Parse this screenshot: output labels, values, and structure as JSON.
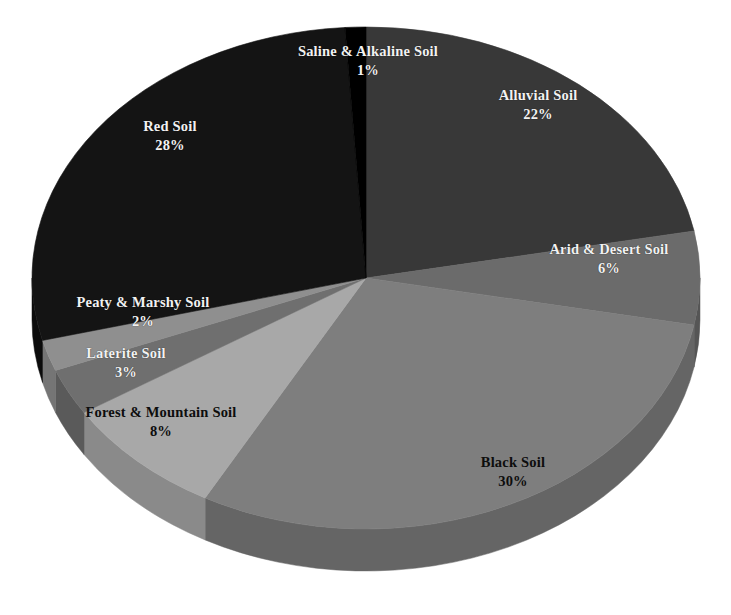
{
  "chart_data": {
    "type": "pie",
    "title": "",
    "subtitle": "",
    "xlabel": "",
    "ylabel": "",
    "legend_position": "none",
    "grid": false,
    "label_format": "name + percent",
    "start_angle_deg": 0,
    "direction": "clockwise",
    "three_d": true,
    "categories": [
      "Alluvial Soil",
      "Arid & Desert Soil",
      "Black Soil",
      "Forest & Mountain Soil",
      "Laterite Soil",
      "Peaty & Marshy Soil",
      "Red Soil",
      "Saline & Alkaline Soil"
    ],
    "values": [
      22,
      6,
      30,
      8,
      3,
      2,
      28,
      1
    ],
    "unit": "%",
    "total": 100,
    "slices": [
      {
        "name": "Alluvial Soil",
        "value": 22,
        "value_label": "22%",
        "color": "#383838",
        "side_color": "#2b2b2b",
        "label_color": "light"
      },
      {
        "name": "Arid & Desert Soil",
        "value": 6,
        "value_label": "6%",
        "color": "#6b6b6b",
        "side_color": "#555555",
        "label_color": "light"
      },
      {
        "name": "Black Soil",
        "value": 30,
        "value_label": "30%",
        "color": "#7e7e7e",
        "side_color": "#656565",
        "label_color": "dark"
      },
      {
        "name": "Forest & Mountain Soil",
        "value": 8,
        "value_label": "8%",
        "color": "#a8a8a8",
        "side_color": "#8a8a8a",
        "label_color": "dark"
      },
      {
        "name": "Laterite Soil",
        "value": 3,
        "value_label": "3%",
        "color": "#6f6f6f",
        "side_color": "#5a5a5a",
        "label_color": "light"
      },
      {
        "name": "Peaty & Marshy Soil",
        "value": 2,
        "value_label": "2%",
        "color": "#8f8f8f",
        "side_color": "#757575",
        "label_color": "light"
      },
      {
        "name": "Red Soil",
        "value": 28,
        "value_label": "28%",
        "color": "#141414",
        "side_color": "#0c0c0c",
        "label_color": "light"
      },
      {
        "name": "Saline & Alkaline Soil",
        "value": 1,
        "value_label": "1%",
        "color": "#000000",
        "side_color": "#000000",
        "label_color": "light"
      }
    ],
    "background_color": "#ffffff"
  },
  "geometry": {
    "cx": 366,
    "cy": 278,
    "rx": 334,
    "ry": 251,
    "depth": 42
  }
}
